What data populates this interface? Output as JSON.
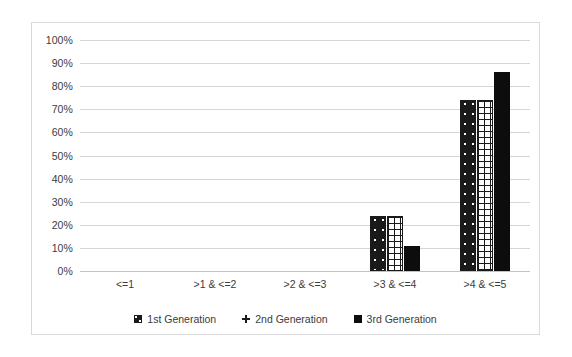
{
  "chart_data": {
    "type": "bar",
    "title": "",
    "subtitle": "",
    "xlabel": "",
    "ylabel": "",
    "categories": [
      "<=1",
      ">1 & <=2",
      ">2 & <=3",
      ">3 & <=4",
      ">4 & <=5"
    ],
    "series": [
      {
        "name": "1st Generation",
        "pattern": "black-with-white-dots",
        "color": "#1a1a1a",
        "values": [
          0,
          0,
          0,
          24,
          74
        ]
      },
      {
        "name": "2nd Generation",
        "pattern": "white-with-black-crosshatch",
        "color": "#1a1a1a",
        "values": [
          0,
          0,
          0,
          24,
          74
        ]
      },
      {
        "name": "3rd Generation",
        "pattern": "solid-black",
        "color": "#0d0d0d",
        "values": [
          0,
          0,
          0,
          11,
          86
        ]
      }
    ],
    "ylim": [
      0,
      100
    ],
    "ytick_values": [
      0,
      10,
      20,
      30,
      40,
      50,
      60,
      70,
      80,
      90,
      100
    ],
    "ytick_labels": [
      "0%",
      "10%",
      "20%",
      "30%",
      "40%",
      "50%",
      "60%",
      "70%",
      "80%",
      "90%",
      "100%"
    ],
    "value_suffix": "%",
    "grid": true,
    "grid_axis": "y",
    "legend_position": "bottom",
    "legend_entries": [
      "1st Generation",
      "2nd Generation",
      "3rd Generation"
    ],
    "annotations": [],
    "colors": {
      "gridline": "#d6d6d6",
      "axis": "#c3c3c3",
      "frame": "#d9d9d9",
      "text": "#3b3b3b",
      "background": "#ffffff"
    }
  }
}
